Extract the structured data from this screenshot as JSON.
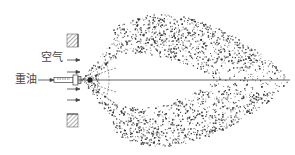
{
  "diagram": {
    "type": "oil-burner-spray-flame",
    "labels": {
      "air": "空气",
      "heavy_oil": "重油"
    },
    "colors": {
      "ink": "#333333",
      "background": "#ffffff",
      "hatch": "#777777"
    },
    "elements": [
      {
        "name": "upper-wall-block",
        "kind": "hatched-rectangle"
      },
      {
        "name": "lower-wall-block",
        "kind": "hatched-rectangle"
      },
      {
        "name": "oil-nozzle",
        "kind": "nozzle"
      },
      {
        "name": "air-flow-arrows",
        "kind": "arrows",
        "count": 5
      },
      {
        "name": "oil-feed-arrow",
        "kind": "arrow"
      },
      {
        "name": "spray-cone",
        "kind": "dashed-cone"
      },
      {
        "name": "droplet-cloud",
        "kind": "stippled-region"
      },
      {
        "name": "centerline",
        "kind": "axis-line"
      }
    ]
  }
}
